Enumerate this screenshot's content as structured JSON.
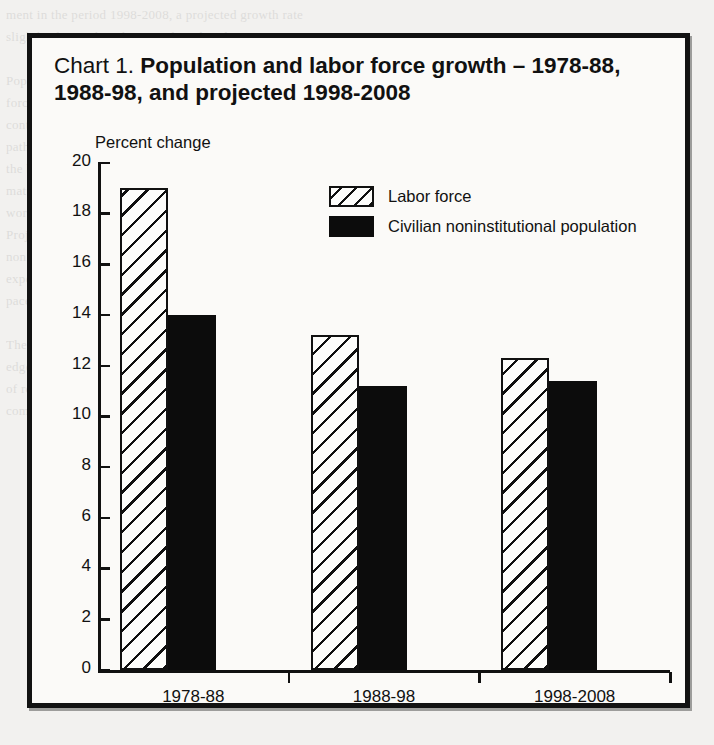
{
  "chart": {
    "title_prefix": "Chart 1. ",
    "title_main": "Population and labor force growth – 1978-88, 1988-98, and projected 1998-2008",
    "axis_label": "Percent change",
    "legend": [
      {
        "label": "Labor force",
        "style": "hatched"
      },
      {
        "label": "Civilian noninstitutional population",
        "style": "solid"
      }
    ]
  },
  "chart_data": {
    "type": "bar",
    "title": "Chart 1. Population and labor force growth – 1978-88, 1988-98, and projected 1998-2008",
    "xlabel": "",
    "ylabel": "Percent change",
    "ylim": [
      0,
      20
    ],
    "yticks": [
      0,
      2,
      4,
      6,
      8,
      10,
      12,
      14,
      16,
      18,
      20
    ],
    "ytick_labels": [
      "0",
      "2",
      "4",
      "6",
      "8",
      "10",
      "12",
      "14",
      "16",
      "18",
      "20"
    ],
    "grid": false,
    "legend_position": "upper center",
    "categories": [
      "1978-88",
      "1988-98",
      "1998-2008"
    ],
    "series": [
      {
        "name": "Labor force",
        "values": [
          19.0,
          13.2,
          12.3
        ],
        "fill": "hatched",
        "color": "#111111"
      },
      {
        "name": "Civilian noninstitutional population",
        "values": [
          14.0,
          11.2,
          11.4
        ],
        "fill": "solid",
        "color": "#0c0c0c"
      }
    ]
  },
  "ghost_lines": [
    "ment in the period 1998-2008, a projected growth rate",
    "slightly slower than the preceding decade.",
    "",
    "Population growth and labor",
    "force growth are expected to",
    "continue to move along parallel",
    "paths over the next decade, as",
    "the baby-boom generation",
    "matures and the share of older",
    "workers in the labor force rises.",
    "Projected growth of the civilian",
    "noninstitutional population is",
    "expected to remain near the",
    "pace recorded during 1988-98.",
    "",
    "The labor force participation rate is projected to",
    "edge up over the 1998-2008 period, reaching a level",
    "of roughly 67.6 percent by the end of the decade,",
    "compared with 67.1 percent in 1998."
  ]
}
